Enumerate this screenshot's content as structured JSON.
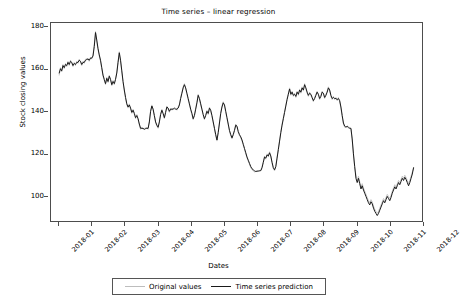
{
  "figure": {
    "title": "Time series – linear regression",
    "background": "#ffffff"
  },
  "axes": {
    "xlabel": "Dates",
    "ylabel": "Stock closing values",
    "yticks": [
      "100",
      "120",
      "140",
      "160",
      "180"
    ],
    "xticks": [
      "2018-01",
      "2018-02",
      "2018-03",
      "2018-04",
      "2018-05",
      "2018-06",
      "2018-07",
      "2018-08",
      "2018-09",
      "2018-10",
      "2018-11",
      "2018-12"
    ]
  },
  "legend": {
    "items": [
      {
        "label": "Original values",
        "color": "#bdbdbd"
      },
      {
        "label": "Time series prediction",
        "color": "#1a1a1a"
      }
    ]
  },
  "chart_data": {
    "type": "line",
    "title": "Time series – linear regression",
    "xlabel": "Dates",
    "ylabel": "Stock closing values",
    "grid": false,
    "legend_position": "bottom",
    "xlim": [
      "2018-01-01",
      "2018-12-01"
    ],
    "ylim": [
      88,
      182
    ],
    "ytick_values": [
      100,
      120,
      140,
      160,
      180
    ],
    "xtick_labels": [
      "2018-01",
      "2018-02",
      "2018-03",
      "2018-04",
      "2018-05",
      "2018-06",
      "2018-07",
      "2018-08",
      "2018-09",
      "2018-10",
      "2018-11",
      "2018-12"
    ],
    "x_fraction_start": 0.022,
    "x_fraction_end": 0.972,
    "series": [
      {
        "name": "Original values",
        "color": "#bdbdbd",
        "values": [
          157.5,
          161.0,
          159.0,
          162.5,
          160.5,
          163.0,
          161.5,
          164.0,
          162.0,
          164.5,
          163.0,
          161.5,
          163.5,
          162.0,
          164.0,
          163.0,
          165.0,
          163.5,
          162.0,
          164.0,
          163.0,
          165.0,
          164.5,
          165.5,
          164.0,
          166.0,
          165.0,
          167.0,
          172.0,
          178.0,
          173.0,
          169.5,
          166.5,
          164.0,
          160.5,
          157.0,
          155.0,
          153.0,
          156.5,
          154.0,
          157.5,
          155.0,
          152.5,
          155.0,
          153.0,
          156.0,
          159.0,
          164.0,
          168.5,
          164.0,
          159.0,
          154.0,
          150.0,
          146.5,
          143.5,
          142.0,
          144.0,
          141.5,
          139.5,
          141.5,
          139.0,
          137.0,
          139.0,
          136.5,
          134.0,
          132.0,
          133.0,
          132.0,
          132.5,
          132.0,
          133.0,
          132.0,
          136.0,
          141.0,
          143.5,
          141.0,
          138.0,
          135.0,
          133.5,
          132.5,
          136.0,
          139.5,
          141.5,
          139.0,
          137.0,
          140.5,
          143.0,
          141.5,
          140.0,
          142.0,
          141.0,
          142.0,
          141.5,
          142.0,
          141.0,
          142.5,
          144.0,
          147.0,
          149.5,
          152.0,
          153.5,
          151.0,
          148.5,
          146.0,
          143.5,
          141.0,
          139.0,
          136.5,
          139.0,
          142.0,
          145.0,
          148.5,
          146.0,
          143.5,
          141.0,
          138.5,
          136.5,
          139.0,
          141.0,
          139.0,
          142.5,
          140.5,
          138.0,
          135.0,
          132.0,
          129.0,
          126.5,
          131.0,
          135.5,
          140.0,
          143.0,
          145.0,
          143.0,
          140.0,
          137.0,
          134.0,
          131.0,
          129.0,
          127.5,
          130.0,
          132.0,
          134.5,
          133.0,
          130.5,
          129.0,
          128.0,
          126.5,
          124.5,
          122.5,
          120.5,
          118.5,
          117.0,
          115.5,
          114.0,
          113.0,
          112.5,
          112.0,
          112.3,
          112.1,
          112.5,
          112.2,
          112.8,
          114.5,
          117.0,
          119.5,
          118.0,
          120.5,
          119.0,
          121.5,
          119.0,
          116.0,
          113.5,
          112.5,
          115.0,
          119.0,
          123.0,
          127.0,
          131.0,
          134.5,
          137.5,
          140.5,
          143.5,
          146.5,
          149.0,
          151.5,
          148.0,
          150.0,
          147.5,
          149.0,
          147.0,
          150.0,
          148.0,
          151.0,
          149.0,
          152.0,
          150.0,
          153.5,
          151.0,
          149.0,
          147.5,
          149.5,
          148.0,
          146.5,
          145.0,
          147.0,
          148.5,
          150.0,
          148.0,
          146.0,
          148.0,
          150.0,
          148.5,
          146.5,
          148.5,
          150.0,
          152.0,
          150.0,
          147.5,
          146.0,
          147.5,
          146.0,
          147.0,
          145.5,
          147.0,
          145.0,
          142.0,
          138.0,
          134.5,
          133.0,
          133.5,
          133.0,
          132.5,
          133.0,
          132.0,
          127.0,
          120.0,
          114.0,
          110.5,
          108.0,
          110.0,
          107.5,
          105.0,
          106.5,
          104.5,
          103.0,
          101.5,
          100.0,
          98.5,
          97.5,
          99.0,
          98.0,
          96.0,
          94.5,
          93.5,
          92.5,
          93.5,
          95.0,
          96.5,
          98.0,
          99.5,
          98.5,
          100.0,
          101.5,
          100.5,
          99.5,
          101.0,
          103.0,
          104.5,
          106.0,
          105.0,
          106.5,
          108.0,
          107.0,
          108.5,
          110.0,
          109.0,
          110.5,
          109.5,
          108.0,
          106.5,
          108.0,
          110.0,
          112.0,
          113.5
        ],
        "linewidth": 0.8
      },
      {
        "name": "Time series prediction",
        "color": "#1a1a1a",
        "values": [
          158.5,
          160.5,
          159.5,
          162.0,
          161.0,
          162.5,
          162.0,
          163.5,
          162.5,
          164.0,
          163.5,
          162.0,
          163.0,
          162.5,
          163.5,
          163.5,
          164.5,
          164.0,
          162.5,
          163.5,
          163.5,
          164.5,
          165.0,
          165.0,
          164.5,
          165.5,
          165.5,
          166.5,
          171.0,
          177.5,
          174.0,
          170.0,
          167.0,
          164.5,
          161.0,
          157.5,
          155.5,
          153.5,
          156.0,
          154.5,
          157.0,
          155.5,
          153.0,
          154.5,
          153.5,
          155.5,
          158.5,
          163.5,
          168.0,
          164.5,
          159.5,
          154.5,
          150.5,
          147.0,
          144.0,
          142.5,
          143.5,
          142.0,
          140.0,
          141.0,
          139.5,
          137.5,
          138.5,
          137.0,
          134.5,
          132.5,
          132.5,
          132.5,
          132.0,
          132.5,
          132.5,
          132.5,
          135.5,
          140.5,
          143.0,
          141.5,
          138.5,
          135.5,
          134.0,
          133.0,
          135.5,
          139.0,
          141.0,
          139.5,
          137.5,
          140.0,
          142.5,
          142.0,
          140.5,
          141.5,
          141.5,
          141.5,
          142.0,
          141.5,
          141.5,
          142.0,
          143.5,
          146.5,
          149.0,
          151.5,
          153.0,
          151.5,
          149.0,
          146.5,
          144.0,
          141.5,
          139.5,
          137.0,
          138.5,
          141.5,
          144.5,
          148.0,
          146.5,
          144.0,
          141.5,
          139.0,
          137.0,
          138.5,
          140.5,
          139.5,
          142.0,
          141.0,
          138.5,
          135.5,
          132.5,
          129.5,
          127.0,
          130.5,
          135.0,
          139.5,
          142.5,
          144.5,
          143.5,
          140.5,
          137.5,
          134.5,
          131.5,
          129.5,
          128.0,
          129.5,
          131.5,
          134.0,
          133.5,
          131.0,
          129.5,
          128.5,
          127.0,
          125.0,
          123.0,
          121.0,
          119.0,
          117.5,
          116.0,
          114.5,
          113.5,
          113.0,
          112.5,
          112.2,
          112.4,
          112.4,
          112.6,
          112.6,
          114.0,
          116.5,
          119.0,
          118.5,
          120.0,
          119.5,
          121.0,
          119.5,
          116.5,
          114.0,
          113.0,
          114.5,
          118.5,
          122.5,
          126.5,
          130.5,
          134.0,
          137.0,
          140.0,
          143.0,
          146.0,
          148.5,
          151.0,
          148.5,
          149.5,
          148.0,
          148.5,
          147.5,
          149.5,
          148.5,
          150.5,
          149.5,
          151.5,
          150.5,
          153.0,
          151.5,
          149.5,
          148.0,
          149.0,
          148.5,
          147.0,
          145.5,
          146.5,
          148.0,
          149.5,
          148.5,
          146.5,
          147.5,
          149.5,
          149.0,
          147.0,
          148.0,
          149.5,
          151.5,
          150.5,
          148.0,
          146.5,
          147.0,
          146.5,
          146.5,
          146.0,
          146.5,
          145.5,
          142.5,
          138.5,
          135.0,
          133.5,
          133.0,
          133.5,
          133.0,
          132.5,
          132.5,
          127.5,
          120.5,
          114.5,
          109.0,
          107.0,
          109.0,
          106.5,
          104.0,
          105.5,
          103.5,
          102.0,
          100.5,
          99.0,
          97.5,
          96.5,
          98.0,
          97.0,
          95.0,
          93.5,
          92.5,
          91.5,
          92.5,
          94.0,
          95.5,
          97.0,
          98.5,
          97.5,
          99.0,
          100.5,
          99.5,
          98.5,
          100.0,
          102.0,
          103.5,
          105.0,
          104.0,
          105.5,
          107.0,
          106.0,
          107.5,
          109.0,
          108.0,
          109.5,
          108.5,
          107.0,
          105.5,
          107.0,
          109.0,
          111.0,
          114.0
        ],
        "linewidth": 1.0
      }
    ]
  }
}
